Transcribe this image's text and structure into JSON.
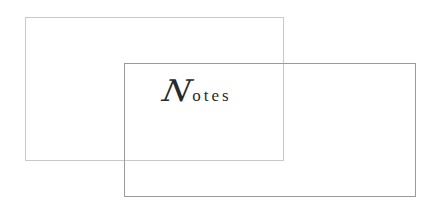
{
  "title": {
    "initial": "N",
    "rest": "otes",
    "full": "Notes",
    "color": "#2a2a2a"
  },
  "shapes": {
    "back_rect": {
      "border_color": "#c9c9c9"
    },
    "front_rect": {
      "border_color": "#9a9a9a"
    }
  }
}
